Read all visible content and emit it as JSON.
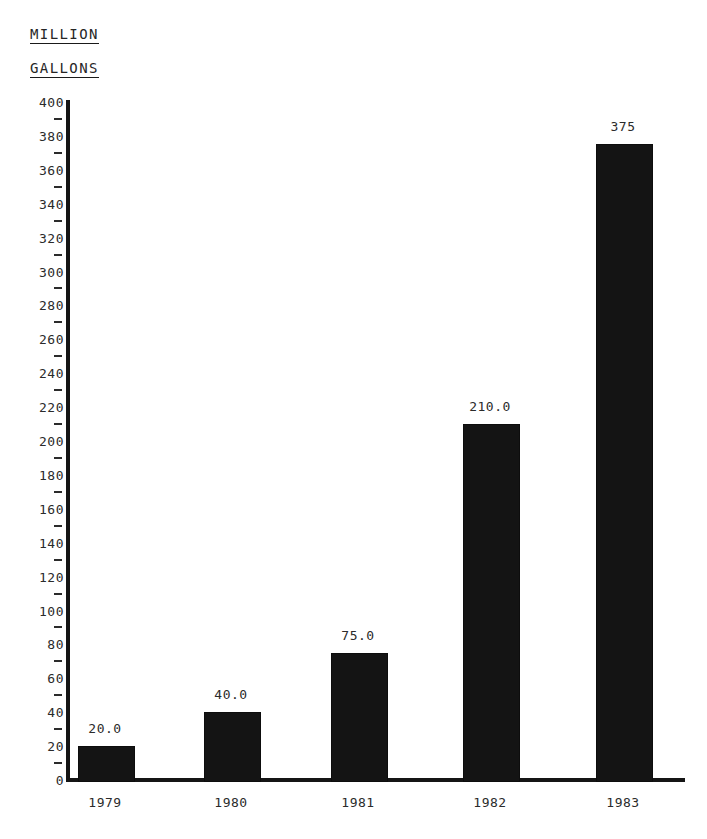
{
  "heading": {
    "line1": "MILLION",
    "line2": "GALLONS"
  },
  "caption": {
    "clipped_text": ""
  },
  "chart_data": {
    "type": "bar",
    "title": "",
    "subtitle": "",
    "xlabel": "",
    "ylabel": "MILLION GALLONS",
    "categories": [
      "1979",
      "1980",
      "1981",
      "1982",
      "1983"
    ],
    "values": [
      20.0,
      40.0,
      75.0,
      210.0,
      375
    ],
    "value_labels": [
      "20.0",
      "40.0",
      "75.0",
      "210.0",
      "375"
    ],
    "ylim": [
      0,
      400
    ],
    "ytick_step": 20,
    "yticks": [
      0,
      20,
      40,
      60,
      80,
      100,
      120,
      140,
      160,
      180,
      200,
      220,
      240,
      260,
      280,
      300,
      320,
      340,
      360,
      380,
      400
    ],
    "ytick_labels": [
      "0",
      "20",
      "40",
      "60",
      "80",
      "100",
      "120",
      "140",
      "160",
      "180",
      "200",
      "220",
      "240",
      "260",
      "280",
      "300",
      "320",
      "340",
      "360",
      "380",
      "400"
    ],
    "minor_ticks": [
      10,
      30,
      50,
      70,
      90,
      110,
      130,
      150,
      170,
      190,
      210,
      230,
      250,
      270,
      290,
      310,
      330,
      350,
      370,
      390
    ],
    "grid": false,
    "legend": null,
    "bar_color": "#141414",
    "axis_color": "#151515",
    "background_color": "#ffffff"
  }
}
